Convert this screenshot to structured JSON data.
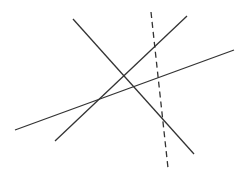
{
  "diagram": {
    "width": 242,
    "height": 174,
    "background": "#ffffff",
    "line_color": "#333333",
    "lines": [
      {
        "id": "line-a",
        "x1": 73,
        "y1": 19,
        "x2": 194,
        "y2": 154,
        "style": "solid"
      },
      {
        "id": "line-b",
        "x1": 55,
        "y1": 141,
        "x2": 187,
        "y2": 16,
        "style": "solid"
      },
      {
        "id": "line-c",
        "x1": 15,
        "y1": 130,
        "x2": 234,
        "y2": 50,
        "style": "solid"
      },
      {
        "id": "line-d",
        "x1": 151,
        "y1": 12,
        "x2": 168,
        "y2": 168,
        "style": "dashed"
      }
    ]
  }
}
